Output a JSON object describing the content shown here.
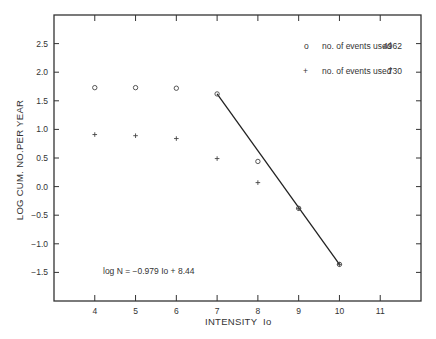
{
  "chart_data": {
    "type": "scatter",
    "title": "",
    "xlabel": "INTENSITY  Io",
    "ylabel": "LOG CUM. NO.PER YEAR",
    "xlim": [
      3,
      12
    ],
    "ylim": [
      -2.0,
      3.0
    ],
    "xticks": [
      4,
      5,
      6,
      7,
      8,
      9,
      10,
      11
    ],
    "yticks": [
      2.5,
      2.0,
      1.5,
      1.0,
      0.5,
      0.0,
      -0.5,
      -1.0,
      -1.5
    ],
    "ytick_labels": [
      "2.5",
      "2.0",
      "1.5",
      "1.0",
      "0.5",
      "0.0",
      "-0.5",
      "-1.0",
      "-1.5"
    ],
    "grid": false,
    "legend_position": "upper right",
    "series": [
      {
        "name": "no. of events used 4962",
        "marker": "o",
        "x": [
          4,
          5,
          6,
          7,
          8,
          9,
          10
        ],
        "y": [
          1.73,
          1.73,
          1.72,
          1.62,
          0.44,
          -0.38,
          -1.36
        ]
      },
      {
        "name": "no. of events used 730",
        "marker": "+",
        "x": [
          4,
          5,
          6,
          7,
          8,
          9,
          10
        ],
        "y": [
          0.91,
          0.89,
          0.84,
          0.49,
          0.07,
          -0.38,
          -1.36
        ]
      }
    ],
    "fit_line": {
      "equation": "log N = -0.979 Io + 8.44",
      "x": [
        7,
        10
      ],
      "y": [
        1.62,
        -1.36
      ]
    }
  },
  "legend": [
    {
      "symbol": "o",
      "label": "no. of events used",
      "count": "4962"
    },
    {
      "symbol": "+",
      "label": "no. of events used",
      "count": "730"
    }
  ],
  "annotation": "log N = −0.979 Io + 8.44",
  "axes": {
    "xlabel": "INTENSITY  Io",
    "ylabel": "LOG CUM. NO.PER YEAR"
  }
}
